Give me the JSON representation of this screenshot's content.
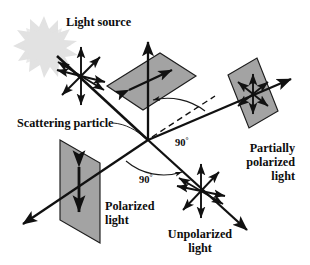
{
  "figure": {
    "background_color": "#ffffff",
    "ink_color": "#111111",
    "plane_fill_color": "#a3a3a3",
    "plane_stroke_color": "#1d1d1d",
    "sun_color": "#e2e2e2",
    "width": 310,
    "height": 265
  },
  "labels": {
    "light_source": "Light source",
    "scattering_particle": "Scattering particle",
    "polarized_light": "Polarized",
    "polarized_light_second_line": "light",
    "unpolarized_light": "Unpolarized",
    "unpolarized_light_second_line": "light",
    "partially_polarized_line1": "Partially",
    "partially_polarized_line2": "polarized",
    "partially_polarized_line3": "light",
    "angle_right": "90",
    "angle_right_degree": "°",
    "angle_bottom": "90",
    "angle_bottom_degree": "°"
  },
  "elements": {
    "sun_name": "light-source-starburst",
    "particle_name": "scattering-particle-vertex",
    "incident_beam": "incident-unpolarized-beam",
    "top_plane": "vertical-polarization-plane-top",
    "left_plane": "polarized-light-plane",
    "right_plane": "partially-polarized-light-plane",
    "unpolarized_burst": "unpolarized-light-starburst",
    "partially_burst": "partially-polarized-starburst",
    "incident_burst": "incident-light-starburst",
    "dashed_reference": "dashed-reference-line",
    "arc_right": "right-angle-arc-upper",
    "arc_bottom": "right-angle-arc-lower"
  }
}
